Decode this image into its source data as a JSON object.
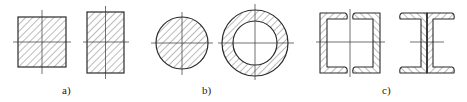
{
  "figure": {
    "colors": {
      "stroke": "#2a2a2a",
      "hatch": "#555555",
      "axis": "#333333",
      "background": "#ffffff"
    },
    "panels": [
      {
        "id": "a",
        "label": "a)",
        "label_pos": [
          62,
          85
        ],
        "shapes": [
          {
            "type": "square-section",
            "x": 18,
            "y": 17,
            "w": 48,
            "h": 50
          },
          {
            "type": "rectangle-section",
            "x": 87,
            "y": 12,
            "w": 37,
            "h": 61
          }
        ]
      },
      {
        "id": "b",
        "label": "b)",
        "label_pos": [
          202,
          85
        ],
        "shapes": [
          {
            "type": "solid-circle-section",
            "cx": 182,
            "cy": 43,
            "r": 26
          },
          {
            "type": "ring-section",
            "cx": 255,
            "cy": 43,
            "r_outer": 33,
            "r_inner": 22
          }
        ]
      },
      {
        "id": "c",
        "label": "c)",
        "label_pos": [
          382,
          85
        ],
        "shapes": [
          {
            "type": "double-channel-section",
            "x": 320,
            "y": 13,
            "w": 60,
            "h": 60
          },
          {
            "type": "i-section-from-channels",
            "x": 400,
            "y": 13,
            "w": 56,
            "h": 60
          }
        ]
      }
    ]
  }
}
